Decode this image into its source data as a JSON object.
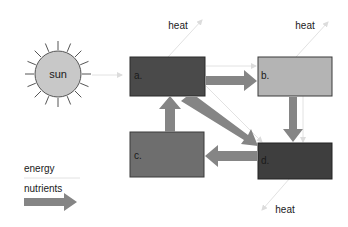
{
  "diagram": {
    "sun": {
      "label": "sun",
      "color": "#c8c8c8"
    },
    "heat_labels": [
      "heat",
      "heat",
      "heat"
    ],
    "boxes": [
      {
        "id": "a",
        "label": "a.",
        "color": "#4a4a4a"
      },
      {
        "id": "b",
        "label": "b.",
        "color": "#b4b4b4"
      },
      {
        "id": "c",
        "label": "c.",
        "color": "#6e6e6e"
      },
      {
        "id": "d",
        "label": "d.",
        "color": "#3e3e3e"
      }
    ],
    "nutrient_flows": [
      {
        "from": "a",
        "to": "b"
      },
      {
        "from": "b",
        "to": "d"
      },
      {
        "from": "a",
        "to": "d"
      },
      {
        "from": "d",
        "to": "c"
      },
      {
        "from": "c",
        "to": "a"
      }
    ],
    "energy_flows": [
      {
        "from": "sun",
        "to": "a"
      },
      {
        "from": "a",
        "to": "heat"
      },
      {
        "from": "b",
        "to": "heat"
      },
      {
        "from": "d",
        "to": "heat"
      },
      {
        "from": "a",
        "to": "b"
      },
      {
        "from": "a",
        "to": "d"
      },
      {
        "from": "b",
        "to": "d"
      }
    ],
    "legend": {
      "energy_label": "energy",
      "nutrients_label": "nutrients",
      "energy_color": "#e0e0e0",
      "nutrients_color": "#858585"
    }
  }
}
